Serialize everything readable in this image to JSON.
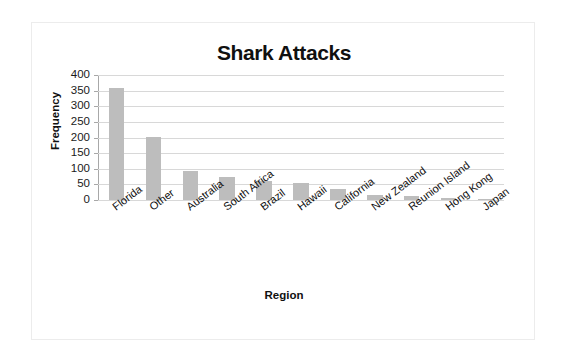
{
  "chart_data": {
    "type": "bar",
    "title": "Shark Attacks",
    "xlabel": "Region",
    "ylabel": "Frequency",
    "categories": [
      "Florida",
      "Other",
      "Australia",
      "South Africa",
      "Brazil",
      "Hawaii",
      "California",
      "New Zealand",
      "Reunion Island",
      "Hong Kong",
      "Japan"
    ],
    "values": [
      360,
      203,
      93,
      73,
      61,
      55,
      35,
      17,
      12,
      5,
      1
    ],
    "ylim": [
      0,
      400
    ],
    "yticks": [
      0,
      50,
      100,
      150,
      200,
      250,
      300,
      350,
      400
    ],
    "ytick_labels": [
      "0",
      "50",
      "100",
      "150",
      "200",
      "250",
      "300",
      "350",
      "400"
    ],
    "grid": true,
    "legend": "none",
    "bar_color": "#bdbdbd",
    "gridline_color": "#d8d8d8",
    "axis_color": "#9a9a9a",
    "text_color": "#101010",
    "background_color": "#ffffff",
    "frame_color": "#ececec"
  }
}
